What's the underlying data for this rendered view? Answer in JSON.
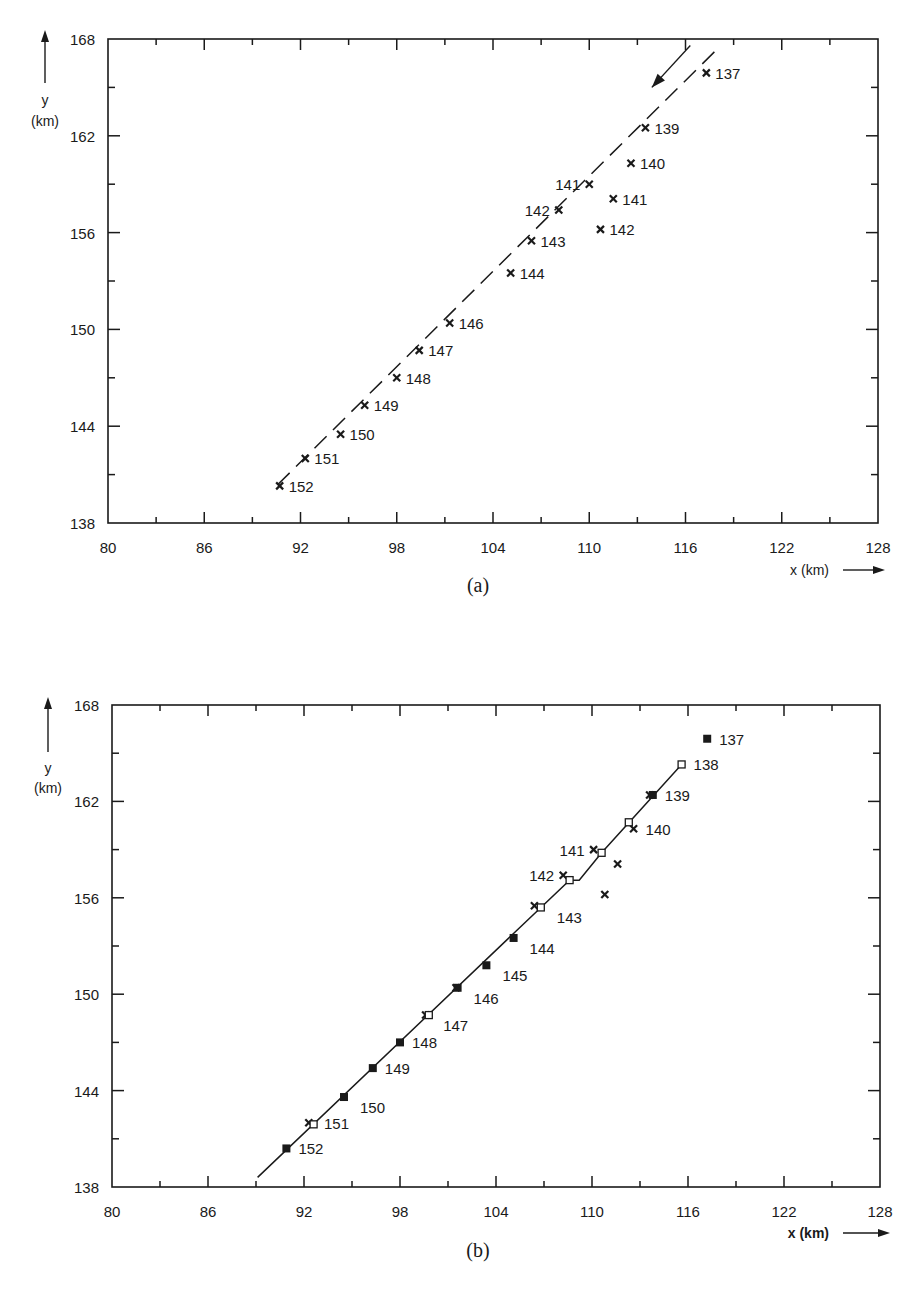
{
  "chart_data": [
    {
      "id": "a",
      "type": "scatter",
      "caption": "(a)",
      "title": "",
      "xlabel": "x (km)",
      "ylabel": "y (km)",
      "xlim": [
        80,
        128
      ],
      "ylim": [
        138,
        168
      ],
      "xticks": [
        80,
        86,
        92,
        98,
        104,
        110,
        116,
        122,
        128
      ],
      "yticks": [
        138,
        144,
        150,
        156,
        162,
        168
      ],
      "grid": false,
      "legend": null,
      "series": [
        {
          "name": "track-points",
          "marker": "x",
          "points": [
            {
              "label": "137",
              "x": 117.3,
              "y": 165.9,
              "label_side": "right"
            },
            {
              "label": "139",
              "x": 113.5,
              "y": 162.5,
              "label_side": "right"
            },
            {
              "label": "140",
              "x": 112.6,
              "y": 160.3,
              "label_side": "right"
            },
            {
              "label": "141",
              "x": 110.0,
              "y": 159.0,
              "label_side": "left"
            },
            {
              "label": "141",
              "x": 111.5,
              "y": 158.1,
              "label_side": "right"
            },
            {
              "label": "142",
              "x": 108.1,
              "y": 157.4,
              "label_side": "left"
            },
            {
              "label": "142",
              "x": 110.7,
              "y": 156.2,
              "label_side": "right"
            },
            {
              "label": "143",
              "x": 106.4,
              "y": 155.5,
              "label_side": "right"
            },
            {
              "label": "144",
              "x": 105.1,
              "y": 153.5,
              "label_side": "right"
            },
            {
              "label": "146",
              "x": 101.3,
              "y": 150.4,
              "label_side": "right"
            },
            {
              "label": "147",
              "x": 99.4,
              "y": 148.7,
              "label_side": "right"
            },
            {
              "label": "148",
              "x": 98.0,
              "y": 147.0,
              "label_side": "right"
            },
            {
              "label": "149",
              "x": 96.0,
              "y": 145.3,
              "label_side": "right"
            },
            {
              "label": "150",
              "x": 94.5,
              "y": 143.5,
              "label_side": "right"
            },
            {
              "label": "151",
              "x": 92.3,
              "y": 142.0,
              "label_side": "right"
            },
            {
              "label": "152",
              "x": 90.7,
              "y": 140.3,
              "label_side": "right"
            }
          ]
        },
        {
          "name": "fitted-track",
          "style": "dashed-line",
          "points": [
            {
              "x": 117.8,
              "y": 167.2
            },
            {
              "x": 90.2,
              "y": 140.0
            }
          ]
        }
      ],
      "annotations": [
        {
          "type": "arrow",
          "description": "direction of motion",
          "from": {
            "x": 116.3,
            "y": 167.6
          },
          "to": {
            "x": 113.9,
            "y": 165.0
          }
        }
      ]
    },
    {
      "id": "b",
      "type": "scatter",
      "caption": "(b)",
      "title": "",
      "xlabel": "x (km)",
      "ylabel": "y (km)",
      "xlim": [
        80,
        128
      ],
      "ylim": [
        138,
        168
      ],
      "xticks": [
        80,
        86,
        92,
        98,
        104,
        110,
        116,
        122,
        128
      ],
      "yticks": [
        138,
        144,
        150,
        156,
        162,
        168
      ],
      "grid": false,
      "legend": null,
      "series": [
        {
          "name": "measured",
          "marker": "x",
          "points": [
            {
              "x": 112.6,
              "y": 160.3
            },
            {
              "x": 110.1,
              "y": 159.0
            },
            {
              "x": 111.6,
              "y": 158.1
            },
            {
              "x": 110.8,
              "y": 156.2
            },
            {
              "x": 108.2,
              "y": 157.4
            },
            {
              "x": 106.4,
              "y": 155.5
            },
            {
              "x": 113.6,
              "y": 162.4
            },
            {
              "x": 101.5,
              "y": 150.4
            },
            {
              "x": 99.6,
              "y": 148.7
            },
            {
              "x": 92.3,
              "y": 142.0
            }
          ]
        },
        {
          "name": "estimated",
          "marker": "open-square",
          "points": [
            {
              "label": "138",
              "x": 115.6,
              "y": 164.3
            },
            {
              "x": 112.3,
              "y": 160.7
            },
            {
              "x": 110.6,
              "y": 158.8
            },
            {
              "x": 108.6,
              "y": 157.1
            },
            {
              "x": 106.8,
              "y": 155.4
            },
            {
              "x": 99.8,
              "y": 148.7
            },
            {
              "x": 92.6,
              "y": 141.9
            }
          ]
        },
        {
          "name": "coincident",
          "marker": "filled-square",
          "points": [
            {
              "label": "137",
              "x": 117.2,
              "y": 165.9
            },
            {
              "label": "139",
              "x": 113.8,
              "y": 162.4
            },
            {
              "label": "144",
              "x": 105.1,
              "y": 153.5
            },
            {
              "label": "145",
              "x": 103.4,
              "y": 151.8
            },
            {
              "label": "146",
              "x": 101.6,
              "y": 150.4
            },
            {
              "label": "148",
              "x": 98.0,
              "y": 147.0
            },
            {
              "label": "149",
              "x": 96.3,
              "y": 145.4
            },
            {
              "label": "150",
              "x": 94.5,
              "y": 143.6
            },
            {
              "label": "152",
              "x": 90.9,
              "y": 140.4
            }
          ]
        },
        {
          "name": "track-line",
          "style": "solid-line",
          "points": [
            {
              "x": 115.6,
              "y": 164.3
            },
            {
              "x": 110.6,
              "y": 158.8
            },
            {
              "x": 109.2,
              "y": 157.1
            },
            {
              "x": 108.6,
              "y": 157.1
            },
            {
              "x": 89.1,
              "y": 138.6
            }
          ]
        }
      ],
      "point_labels": [
        {
          "text": "137",
          "x": 117.2,
          "y": 165.9,
          "side": "right"
        },
        {
          "text": "138",
          "x": 115.6,
          "y": 164.3,
          "side": "right"
        },
        {
          "text": "139",
          "x": 113.8,
          "y": 162.4,
          "side": "right"
        },
        {
          "text": "140",
          "x": 112.6,
          "y": 160.3,
          "side": "right"
        },
        {
          "text": "141",
          "x": 110.1,
          "y": 159.0,
          "side": "left"
        },
        {
          "text": "142",
          "x": 108.2,
          "y": 157.4,
          "side": "left"
        },
        {
          "text": "143",
          "x": 106.8,
          "y": 155.4,
          "side": "right-below"
        },
        {
          "text": "144",
          "x": 105.1,
          "y": 153.5,
          "side": "right-below"
        },
        {
          "text": "145",
          "x": 103.4,
          "y": 151.8,
          "side": "right-below"
        },
        {
          "text": "146",
          "x": 101.6,
          "y": 150.4,
          "side": "right-below"
        },
        {
          "text": "147",
          "x": 99.7,
          "y": 148.7,
          "side": "right-below"
        },
        {
          "text": "148",
          "x": 98.0,
          "y": 147.0,
          "side": "right"
        },
        {
          "text": "149",
          "x": 96.3,
          "y": 145.4,
          "side": "right"
        },
        {
          "text": "150",
          "x": 94.5,
          "y": 143.6,
          "side": "right-below"
        },
        {
          "text": "151",
          "x": 92.5,
          "y": 142.0,
          "side": "right"
        },
        {
          "text": "152",
          "x": 90.9,
          "y": 140.4,
          "side": "right"
        }
      ]
    }
  ],
  "figure": {
    "panel_a": {
      "caption": "(a)",
      "y_axis_label_line1": "y",
      "y_axis_label_line2": "(km)",
      "x_axis_label": "x (km)"
    },
    "panel_b": {
      "caption": "(b)",
      "y_axis_label_line1": "y",
      "y_axis_label_line2": "(km)",
      "x_axis_label": "x (km)"
    },
    "ink_color": "#1a1a1a"
  }
}
